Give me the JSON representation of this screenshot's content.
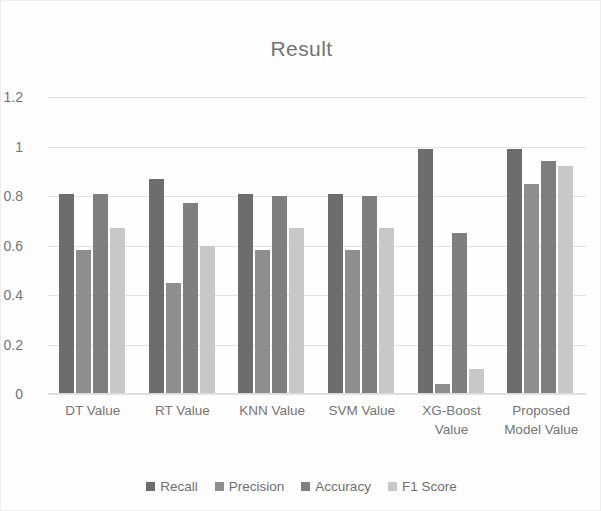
{
  "chart_data": {
    "type": "bar",
    "title": "Result",
    "xlabel": "",
    "ylabel": "",
    "ylim": [
      0,
      1.2
    ],
    "grid": true,
    "legend_position": "bottom",
    "categories": [
      "DT Value",
      "RT Value",
      "KNN Value",
      "SVM Value",
      "XG-Boost Value",
      "Proposed Model Value"
    ],
    "ytick_labels": [
      "0",
      "0.2",
      "0.4",
      "0.6",
      "0.8",
      "1",
      "1.2"
    ],
    "ytick_values": [
      0,
      0.2,
      0.4,
      0.6,
      0.8,
      1,
      1.2
    ],
    "series": [
      {
        "name": "Recall",
        "color": "#6d6d6d",
        "values": [
          0.81,
          0.87,
          0.81,
          0.81,
          0.99,
          0.99
        ]
      },
      {
        "name": "Precision",
        "color": "#8e8e8e",
        "values": [
          0.58,
          0.45,
          0.58,
          0.58,
          0.04,
          0.85
        ]
      },
      {
        "name": "Accuracy",
        "color": "#7f7f7f",
        "values": [
          0.81,
          0.77,
          0.8,
          0.8,
          0.65,
          0.94
        ]
      },
      {
        "name": "F1 Score",
        "color": "#c8c8c8",
        "values": [
          0.67,
          0.6,
          0.67,
          0.67,
          0.1,
          0.92
        ]
      }
    ]
  }
}
